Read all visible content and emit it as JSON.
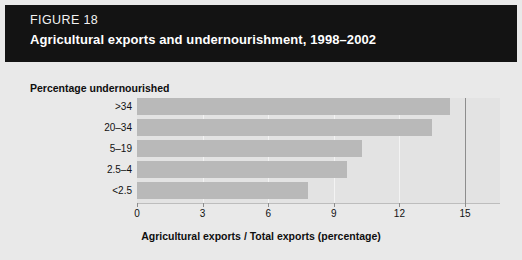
{
  "header": {
    "figure_number": "FIGURE 18",
    "title": "Agricultural exports and undernourishment, 1998–2002",
    "background_color": "#131313",
    "text_color": "#ffffff"
  },
  "colors": {
    "page_background": "#e9e9e9",
    "plot_background": "#e3e3e3",
    "bar_fill": "#b9b9b9",
    "gridline": "#f3f3f3",
    "axis_line": "#8d8d8d",
    "text": "#111111"
  },
  "chart_data": {
    "type": "bar",
    "orientation": "horizontal",
    "title": "Agricultural exports and undernourishment, 1998–2002",
    "subtitle": "FIGURE 18",
    "ylabel": "Percentage undernourished",
    "xlabel": "Agricultural exports / Total exports (percentage)",
    "categories": [
      ">34",
      "20–34",
      "5–19",
      "2.5–4",
      "<2.5"
    ],
    "values": [
      14.3,
      13.5,
      10.3,
      9.6,
      7.8
    ],
    "xlim": [
      0,
      16.6
    ],
    "xticks": [
      0,
      3,
      6,
      9,
      12,
      15
    ],
    "xtick_labels": [
      "0",
      "3",
      "6",
      "9",
      "12",
      "15"
    ],
    "grid": true,
    "legend": null,
    "series": [
      {
        "name": "Agricultural exports / Total exports (percentage)",
        "values": [
          14.3,
          13.5,
          10.3,
          9.6,
          7.8
        ]
      }
    ]
  }
}
